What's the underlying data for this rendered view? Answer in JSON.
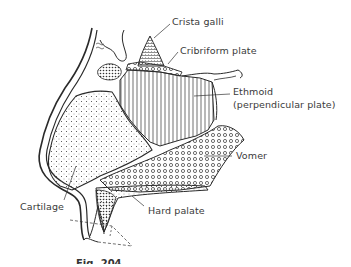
{
  "figure": {
    "caption": "Fig. 204",
    "labels": {
      "crista_galli": "Crista galli",
      "cribriform_plate": "Cribriform plate",
      "ethmoid_line1": "Ethmoid",
      "ethmoid_line2": "(perpendicular plate)",
      "vomer": "Vomer",
      "cartilage": "Cartilage",
      "hard_palate": "Hard palate"
    }
  },
  "colors": {
    "ink": "#2a2a2a",
    "label_text": "#3a3a3a",
    "background": "#ffffff"
  }
}
